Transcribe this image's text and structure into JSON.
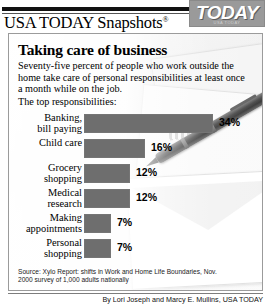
{
  "masthead": {
    "title": "USA TODAY Snapshots",
    "registered_mark": "®",
    "logo_text": "TODAY",
    "logo_sub": "USA TODAY"
  },
  "headline": "Taking care of business",
  "deck": "Seventy-five percent of people who work outside the home take care of  personal responsibilities at least once a month while on the job.",
  "deck_lead": "The top responsibilities:",
  "source": "Source: Xylo Report: shifts in Work and Home Life Boundaries, Nov. 2000 survey of 1,000 adults nationally",
  "byline": "By Lori Joseph and Marcy E. Mullins, USA TODAY",
  "colors": {
    "bar": "#6e6e6e",
    "logo_bg": "#9a9a9a",
    "frame": "#9b9b9b",
    "rule": "#111111"
  },
  "chart_data": {
    "type": "bar",
    "title": "Taking care of business",
    "subtitle": "Seventy-five percent of people who work outside the home take care of  personal responsibilities at least once a month while on the job.",
    "xlabel": "",
    "ylabel": "",
    "orientation": "horizontal",
    "grid": false,
    "legend": "none",
    "xlim": [
      0,
      34
    ],
    "value_suffix": "%",
    "categories": [
      "Banking,\nbill paying",
      "Child care",
      "Grocery\nshopping",
      "Medical\nresearch",
      "Making\nappointments",
      "Personal\nshopping"
    ],
    "values": [
      34,
      16,
      12,
      12,
      7,
      7
    ],
    "value_labels": [
      "34%",
      "16%",
      "12%",
      "12%",
      "7%",
      "7%"
    ]
  },
  "bars": [
    {
      "label": "Banking,\nbill paying",
      "value": 34,
      "value_label": "34%"
    },
    {
      "label": "Child care",
      "value": 16,
      "value_label": "16%"
    },
    {
      "label": "Grocery\nshopping",
      "value": 12,
      "value_label": "12%"
    },
    {
      "label": "Medical\nresearch",
      "value": 12,
      "value_label": "12%"
    },
    {
      "label": "Making\nappointments",
      "value": 7,
      "value_label": "7%"
    },
    {
      "label": "Personal\nshopping",
      "value": 7,
      "value_label": "7%"
    }
  ]
}
